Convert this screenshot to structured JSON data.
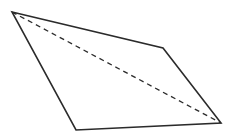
{
  "diagram": {
    "type": "quadrilateral-with-diagonal",
    "background": "#ffffff",
    "stroke_color": "#2b2b2b",
    "vertices": [
      {
        "x": 12,
        "y": 12
      },
      {
        "x": 163,
        "y": 48
      },
      {
        "x": 221,
        "y": 123
      },
      {
        "x": 76,
        "y": 130
      }
    ],
    "diagonal": {
      "from": {
        "x": 12,
        "y": 12
      },
      "to": {
        "x": 221,
        "y": 123
      },
      "style": "dashed"
    }
  }
}
